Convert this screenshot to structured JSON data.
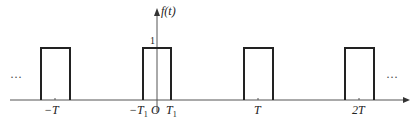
{
  "diagram": {
    "type": "periodic rectangular pulse train",
    "y_axis_label": "f(t)",
    "amplitude_label": "1",
    "origin_label": "O",
    "x_tick_labels": [
      {
        "text": "−T",
        "sub": ""
      },
      {
        "text": "−T",
        "sub": "1"
      },
      {
        "text": "T",
        "sub": "1"
      },
      {
        "text": "T",
        "sub": ""
      },
      {
        "text": "2T",
        "sub": ""
      }
    ],
    "ellipsis_left": "···",
    "ellipsis_right": "···",
    "line_color": "#222222"
  }
}
